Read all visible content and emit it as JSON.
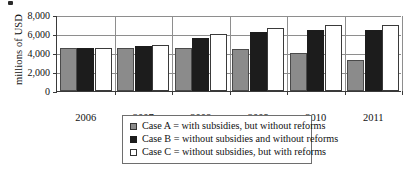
{
  "chart_data": {
    "type": "bar",
    "title": "",
    "subtitle": "",
    "xlabel": "",
    "ylabel": "millions of USD",
    "categories": [
      "2006",
      "2007",
      "2008",
      "2009",
      "2010",
      "2011"
    ],
    "series": [
      {
        "name": "Case A = with subsidies, but without reforms",
        "key": "series-a",
        "color": "#8b8b8b",
        "values": [
          4550,
          4500,
          4500,
          4400,
          4050,
          3300
        ]
      },
      {
        "name": "Case B = without subsidies and without reforms",
        "key": "series-b",
        "color": "#1c1c1c",
        "values": [
          4550,
          4700,
          5550,
          6200,
          6400,
          6400
        ]
      },
      {
        "name": "Case C = without subsidies, but with reforms",
        "key": "series-c",
        "color": "#ffffff",
        "values": [
          4550,
          4800,
          5950,
          6650,
          7000,
          7000
        ]
      }
    ],
    "ylim": [
      0,
      8000
    ],
    "ytick_labels": [
      "0",
      "2,000",
      "4,000",
      "6,000",
      "8,000"
    ],
    "ytick_values": [
      0,
      2000,
      4000,
      6000,
      8000
    ],
    "grid": true,
    "legend_position": "bottom"
  },
  "legend": {
    "items": [
      {
        "swatch": "series-a",
        "label": "Case A = with subsidies, but without reforms"
      },
      {
        "swatch": "series-b",
        "label": "Case B = without subsidies and without reforms"
      },
      {
        "swatch": "series-c",
        "label": "Case C = without subsidies, but with reforms"
      }
    ]
  }
}
